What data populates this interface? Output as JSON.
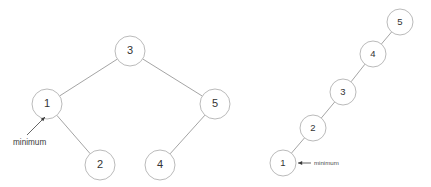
{
  "figure": {
    "background_color": "#ffffff",
    "node_fill_color": "#ffffff",
    "node_stroke_color": "#b2b2b2",
    "edge_color": "#9a9a9a",
    "label_color": "#333333",
    "annotation_color": "#3b3b3b"
  },
  "diagrams": [
    {
      "id": "balanced-tree",
      "name": "balanced-binary-search-tree",
      "nodes": [
        {
          "id": "l-n3",
          "label": "3",
          "cx": 130,
          "cy": 51,
          "r": 15
        },
        {
          "id": "l-n1",
          "label": "1",
          "cx": 47,
          "cy": 104,
          "r": 15
        },
        {
          "id": "l-n5",
          "label": "5",
          "cx": 215,
          "cy": 104,
          "r": 15
        },
        {
          "id": "l-n2",
          "label": "2",
          "cx": 100,
          "cy": 165,
          "r": 15
        },
        {
          "id": "l-n4",
          "label": "4",
          "cx": 160,
          "cy": 165,
          "r": 15
        }
      ],
      "edges": [
        {
          "from": "l-n3",
          "to": "l-n1"
        },
        {
          "from": "l-n3",
          "to": "l-n5"
        },
        {
          "from": "l-n1",
          "to": "l-n2"
        },
        {
          "from": "l-n5",
          "to": "l-n4"
        }
      ],
      "annotation": {
        "label": "minimum",
        "text_x": 13,
        "text_y": 143,
        "arrow_tail_x": 27,
        "arrow_tail_y": 135,
        "arrow_tip_x": 45,
        "arrow_tip_y": 117,
        "target_node": "l-n1"
      }
    },
    {
      "id": "degenerate-chain",
      "name": "right-skewed-linear-tree",
      "nodes": [
        {
          "id": "r-n1",
          "label": "1",
          "cx": 283,
          "cy": 163,
          "r": 13
        },
        {
          "id": "r-n2",
          "label": "2",
          "cx": 313,
          "cy": 128,
          "r": 13
        },
        {
          "id": "r-n3",
          "label": "3",
          "cx": 343,
          "cy": 92,
          "r": 13
        },
        {
          "id": "r-n4",
          "label": "4",
          "cx": 373,
          "cy": 54,
          "r": 13
        },
        {
          "id": "r-n5",
          "label": "5",
          "cx": 400,
          "cy": 22,
          "r": 13
        }
      ],
      "edges": [
        {
          "from": "r-n1",
          "to": "r-n2"
        },
        {
          "from": "r-n2",
          "to": "r-n3"
        },
        {
          "from": "r-n3",
          "to": "r-n4"
        },
        {
          "from": "r-n4",
          "to": "r-n5"
        }
      ],
      "annotation": {
        "label": "minimum",
        "text_x": 314,
        "text_y": 163,
        "arrow_tail_x": 311,
        "arrow_tail_y": 163,
        "arrow_tip_x": 298,
        "arrow_tip_y": 163,
        "target_node": "r-n1"
      }
    }
  ]
}
